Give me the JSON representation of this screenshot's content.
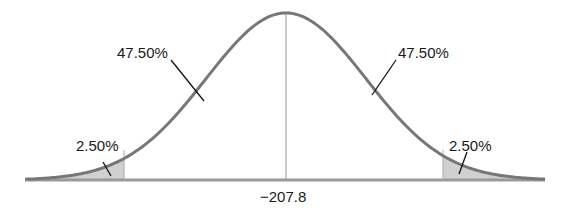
{
  "chart_data": {
    "type": "area",
    "title": "",
    "center_label": "−207.8",
    "regions": [
      {
        "name": "left-tail",
        "percent": "2.50%",
        "shaded": true
      },
      {
        "name": "left-center",
        "percent": "47.50%",
        "shaded": false
      },
      {
        "name": "right-center",
        "percent": "47.50%",
        "shaded": false
      },
      {
        "name": "right-tail",
        "percent": "2.50%",
        "shaded": true
      }
    ],
    "xlabel": "",
    "ylabel": "",
    "grid": false,
    "colors": {
      "curve": "#777777",
      "shade": "#cfcfcf",
      "axis": "#999999",
      "center_line": "#9a9a9a",
      "leader": "#111111"
    }
  },
  "labels": {
    "left_center": "47.50%",
    "right_center": "47.50%",
    "left_tail": "2.50%",
    "right_tail": "2.50%",
    "mean": "−207.8"
  }
}
